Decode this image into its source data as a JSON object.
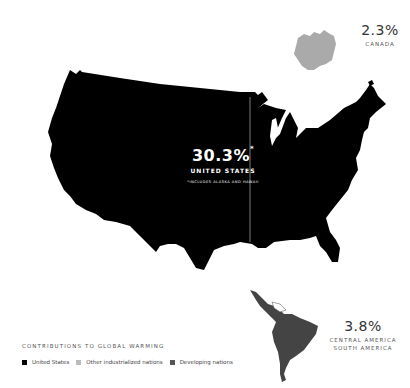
{
  "map": {
    "title": "Contributions to Global Warming",
    "regions": [
      {
        "id": "united-states",
        "name": "UNITED STATES",
        "percent": "30.3%",
        "footnote_mark": "*",
        "footnote": "*INCLUDES ALASKA AND HAWAII",
        "category": "United States",
        "color": "#000000"
      },
      {
        "id": "canada",
        "name": "CANADA",
        "percent": "2.3%",
        "category": "Other industrialized nations",
        "color": "#aaaaaa"
      },
      {
        "id": "central-south-america",
        "name_line1": "CENTRAL AMERICA",
        "name_line2": "SOUTH AMERICA",
        "percent": "3.8%",
        "category": "Developing nations",
        "color": "#444444"
      }
    ]
  },
  "legend": {
    "title": "CONTRIBUTIONS TO GLOBAL WARMING",
    "items": [
      {
        "label": "United States",
        "color": "#000000"
      },
      {
        "label": "Other industrialized nations",
        "color": "#bbbbbb"
      },
      {
        "label": "Developing nations",
        "color": "#555555"
      }
    ]
  }
}
